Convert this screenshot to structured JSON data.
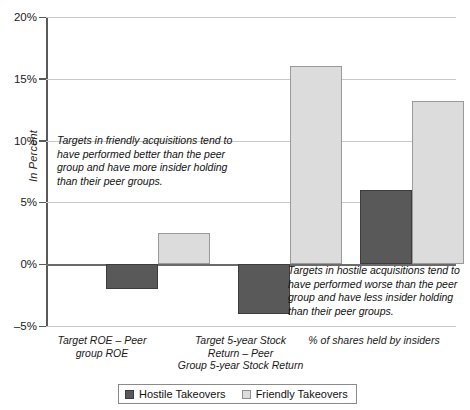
{
  "chart_data": {
    "type": "bar",
    "title": "",
    "xlabel": "",
    "ylabel": "In Percent",
    "ylim": [
      -5,
      20
    ],
    "yticks": [
      -5,
      0,
      5,
      10,
      15,
      20
    ],
    "ytick_labels": [
      "–5%",
      "0%",
      "5%",
      "10%",
      "15%",
      "20%"
    ],
    "grid": true,
    "legend_position": "bottom",
    "categories": [
      "Target ROE – Peer group ROE",
      "Target 5-year Stock Return – Peer Group 5-year Stock Return",
      "% of shares held by insiders"
    ],
    "category_label_lines": [
      [
        "Target ROE – Peer",
        "group ROE"
      ],
      [
        "Target 5-year Stock",
        "Return – Peer",
        "Group 5-year Stock Return"
      ],
      [
        "% of shares held by insiders"
      ]
    ],
    "series": [
      {
        "name": "Hostile Takeovers",
        "color": "#595959",
        "values": [
          -2.0,
          -4.0,
          6.0
        ]
      },
      {
        "name": "Friendly Takeovers",
        "color": "#dcdcdc",
        "values": [
          2.5,
          16.0,
          13.2
        ]
      }
    ],
    "annotations": [
      {
        "id": "friendly-note",
        "text": "Targets in friendly acquisitions tend to have performed better than the peer group and have more insider holding than their peer groups."
      },
      {
        "id": "hostile-note",
        "text": "Targets in hostile acquisitions tend to have performed worse than the peer group and have less insider holding than their peer groups."
      }
    ]
  },
  "legend": {
    "items": [
      {
        "label": "Hostile Takeovers",
        "color": "#595959"
      },
      {
        "label": "Friendly Takeovers",
        "color": "#dcdcdc"
      }
    ]
  },
  "axis": {
    "y_title": "In Percent"
  }
}
